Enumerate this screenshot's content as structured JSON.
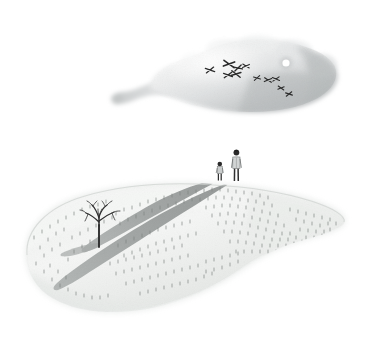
{
  "artwork": {
    "title": "Two Figures on a Floating Island Beneath a Cloud",
    "medium": "watercolor and ink illustration",
    "background_color": "#ffffff",
    "width": 366,
    "height": 340
  },
  "palette": {
    "background": "#ffffff",
    "cloud_light": "#f2f3f3",
    "cloud_mid": "#d8dadb",
    "cloud_dark": "#b7babb",
    "island_light": "#f4f5f4",
    "island_mid": "#e2e5e2",
    "island_edge": "#c9cdca",
    "shadow_gray": "#9a9d9c",
    "grass_tick": "#7d8280",
    "ink_black": "#2a2a2a",
    "moon_white": "#ffffff"
  },
  "sky_island": {
    "name": "upper cloud island",
    "label": "Upper cloud with flying birds and moon",
    "bounds": {
      "x": 105,
      "y": 36,
      "width": 234,
      "height": 78
    },
    "tail": {
      "label": "wispy tail trailing to the left",
      "from_x": 113,
      "to_x": 185
    },
    "moon": {
      "label": "small white moon dot",
      "cx": 286,
      "cy": 63,
      "r": 3.6,
      "color": "#ffffff"
    },
    "birds": {
      "label": "flock of birds",
      "count": 11,
      "marks": [
        {
          "x": 210,
          "y": 70,
          "size": 5.0,
          "rot": -8
        },
        {
          "x": 229,
          "y": 64,
          "size": 6.4,
          "rot": 10
        },
        {
          "x": 238,
          "y": 68,
          "size": 4.6,
          "rot": -14
        },
        {
          "x": 245,
          "y": 66,
          "size": 4.0,
          "rot": 6
        },
        {
          "x": 228,
          "y": 75,
          "size": 4.8,
          "rot": -6
        },
        {
          "x": 236,
          "y": 74,
          "size": 5.4,
          "rot": 12
        },
        {
          "x": 257,
          "y": 78,
          "size": 3.8,
          "rot": -10
        },
        {
          "x": 268,
          "y": 80,
          "size": 4.2,
          "rot": 8
        },
        {
          "x": 275,
          "y": 79,
          "size": 4.0,
          "rot": -4
        },
        {
          "x": 281,
          "y": 87,
          "size": 3.6,
          "rot": 10
        },
        {
          "x": 289,
          "y": 93,
          "size": 3.8,
          "rot": -8
        }
      ]
    }
  },
  "ground_island": {
    "name": "lower ground island",
    "label": "Lower floating island with two figures, bare tree and long shadows",
    "bounds": {
      "x": 22,
      "y": 182,
      "width": 324,
      "height": 132
    },
    "grass": {
      "label": "scattered grass tick marks",
      "count": 230
    },
    "tree": {
      "label": "bare leafless tree",
      "base_x": 99,
      "base_y": 246,
      "height": 30
    },
    "figures": [
      {
        "name": "child-figure",
        "label": "small child standing",
        "x": 220,
        "ground_y": 180,
        "height": 19,
        "head_color": "#2a2a2a",
        "body_color": "#cfd2d2"
      },
      {
        "name": "adult-figure",
        "label": "taller adult standing",
        "x": 236,
        "ground_y": 180,
        "height": 30,
        "head_color": "#2a2a2a",
        "body_color": "#d5d8d8"
      }
    ],
    "shadows": [
      {
        "name": "child-shadow",
        "label": "long shadow cast by child toward lower left",
        "from_x": 220,
        "from_y": 181,
        "to_x": 86,
        "to_y": 250,
        "color": "#9a9d9c"
      },
      {
        "name": "adult-shadow",
        "label": "long shadow cast by adult toward lower left",
        "from_x": 237,
        "from_y": 181,
        "to_x": 62,
        "to_y": 288,
        "color": "#9a9d9c"
      }
    ]
  }
}
